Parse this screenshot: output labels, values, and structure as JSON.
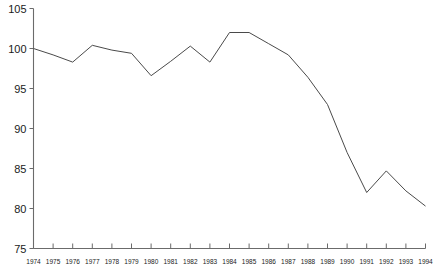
{
  "chart_data": {
    "type": "line",
    "title": "",
    "xlabel": "",
    "ylabel": "",
    "categories": [
      "1974",
      "1975",
      "1976",
      "1977",
      "1978",
      "1979",
      "1980",
      "1981",
      "1982",
      "1983",
      "1984",
      "1985",
      "1986",
      "1987",
      "1988",
      "1989",
      "1990",
      "1991",
      "1992",
      "1993",
      "1994"
    ],
    "x": [
      1974,
      1975,
      1976,
      1977,
      1978,
      1979,
      1980,
      1981,
      1982,
      1983,
      1984,
      1985,
      1986,
      1987,
      1988,
      1989,
      1990,
      1991,
      1992,
      1993,
      1994
    ],
    "values": [
      100.0,
      99.2,
      98.3,
      100.4,
      99.8,
      99.4,
      96.6,
      98.4,
      100.3,
      98.3,
      102.0,
      102.0,
      100.6,
      99.2,
      96.4,
      93.0,
      87.0,
      82.0,
      84.7,
      82.2,
      80.3
    ],
    "series": [
      {
        "name": "index",
        "values": [
          100.0,
          99.2,
          98.3,
          100.4,
          99.8,
          99.4,
          96.6,
          98.4,
          100.3,
          98.3,
          102.0,
          102.0,
          100.6,
          99.2,
          96.4,
          93.0,
          87.0,
          82.0,
          84.7,
          82.2,
          80.3
        ]
      }
    ],
    "ylim": [
      75,
      105
    ],
    "xlim": [
      1974,
      1994
    ],
    "yticks": [
      75,
      80,
      85,
      90,
      95,
      100,
      105
    ],
    "ytick_labels": [
      "75",
      "80",
      "85",
      "90",
      "95",
      "100",
      "105"
    ],
    "xticks": [
      1974,
      1975,
      1976,
      1977,
      1978,
      1979,
      1980,
      1981,
      1982,
      1983,
      1984,
      1985,
      1986,
      1987,
      1988,
      1989,
      1990,
      1991,
      1992,
      1993,
      1994
    ],
    "grid": false,
    "legend": false,
    "legend_position": "none",
    "line_color": "#4a4a4a",
    "axis_color": "#6b6b6b"
  }
}
